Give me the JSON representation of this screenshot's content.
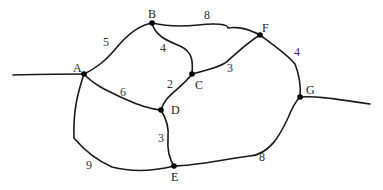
{
  "diagram": {
    "type": "weighted-undirected-graph",
    "nodes": [
      {
        "id": "A",
        "label": "A",
        "x": 84,
        "y": 74,
        "lx": 73,
        "ly": 72
      },
      {
        "id": "B",
        "label": "B",
        "x": 152,
        "y": 23,
        "lx": 148,
        "ly": 18
      },
      {
        "id": "C",
        "label": "C",
        "x": 192,
        "y": 74,
        "lx": 195,
        "ly": 89
      },
      {
        "id": "D",
        "label": "D",
        "x": 161,
        "y": 110,
        "lx": 171,
        "ly": 114
      },
      {
        "id": "E",
        "label": "E",
        "x": 174,
        "y": 166,
        "lx": 171,
        "ly": 181
      },
      {
        "id": "F",
        "label": "F",
        "x": 260,
        "y": 35,
        "lx": 262,
        "ly": 32
      },
      {
        "id": "G",
        "label": "G",
        "x": 300,
        "y": 97,
        "lx": 306,
        "ly": 94
      }
    ],
    "edges": [
      {
        "from": "A",
        "to": "B",
        "weight": "5",
        "wx": 103,
        "wy": 46
      },
      {
        "from": "B",
        "to": "F",
        "weight": "8",
        "wx": 204,
        "wy": 19
      },
      {
        "from": "B",
        "to": "C",
        "weight": "4",
        "wx": 160,
        "wy": 52
      },
      {
        "from": "C",
        "to": "F",
        "weight": "3",
        "wx": 227,
        "wy": 72
      },
      {
        "from": "C",
        "to": "D",
        "weight": "2",
        "wx": 167,
        "wy": 88
      },
      {
        "from": "A",
        "to": "D",
        "weight": "6",
        "wx": 120,
        "wy": 96
      },
      {
        "from": "D",
        "to": "E",
        "weight": "3",
        "wx": 158,
        "wy": 142
      },
      {
        "from": "A",
        "to": "E",
        "weight": "9",
        "wx": 86,
        "wy": 169
      },
      {
        "from": "F",
        "to": "G",
        "weight": "4",
        "wx": 294,
        "wy": 56
      },
      {
        "from": "E",
        "to": "G",
        "weight": "8",
        "wx": 259,
        "wy": 161
      }
    ],
    "stubs": [
      {
        "attached_to": "A",
        "direction": "left"
      },
      {
        "attached_to": "G",
        "direction": "right"
      }
    ]
  }
}
